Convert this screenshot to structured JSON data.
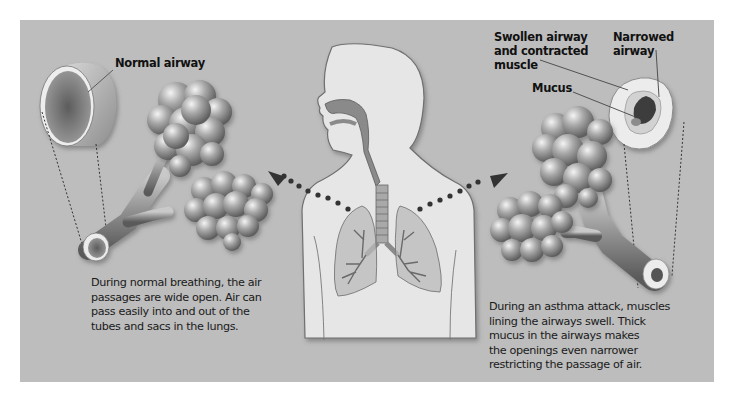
{
  "diagram": {
    "colors": {
      "panel": "#bdbdbd",
      "body_fill": "#e6e6e6",
      "airway_dark": "#7a7a7a",
      "dots": "#333333"
    },
    "left": {
      "label": "Normal airway",
      "caption_lines": [
        "During normal breathing, the air",
        "passages are wide open. Air can",
        "pass easily into and out of the",
        "tubes and sacs in the lungs."
      ]
    },
    "right": {
      "labels": {
        "swollen": [
          "Swollen airway",
          "and contracted",
          "muscle"
        ],
        "narrowed": [
          "Narrowed",
          "airway"
        ],
        "mucus": "Mucus"
      },
      "caption_lines": [
        "During an asthma attack, muscles",
        "lining the airways swell. Thick",
        "mucus in the airways makes",
        "the openings even narrower",
        "restricting the passage of air."
      ]
    },
    "center": {
      "figure": "human-torso-with-lungs"
    }
  }
}
